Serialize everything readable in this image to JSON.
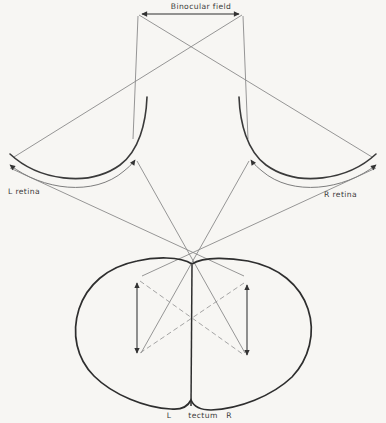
{
  "labels": {
    "binocular_field": "Binocular field",
    "left_retina": "L retina",
    "right_retina": "R retina",
    "tectum_left": "L",
    "tectum_center": "tectum",
    "tectum_right": "R"
  },
  "colors": {
    "paper": "#f7f6f3",
    "ink": "#2e2e2e",
    "retina_arc": "#3a3a3a",
    "projection_line": "#8a8a8a",
    "image_arrow": "#7d7d7d",
    "tectal_arrow": "#3a3a3a",
    "dashed_line": "#9b9b9b"
  }
}
